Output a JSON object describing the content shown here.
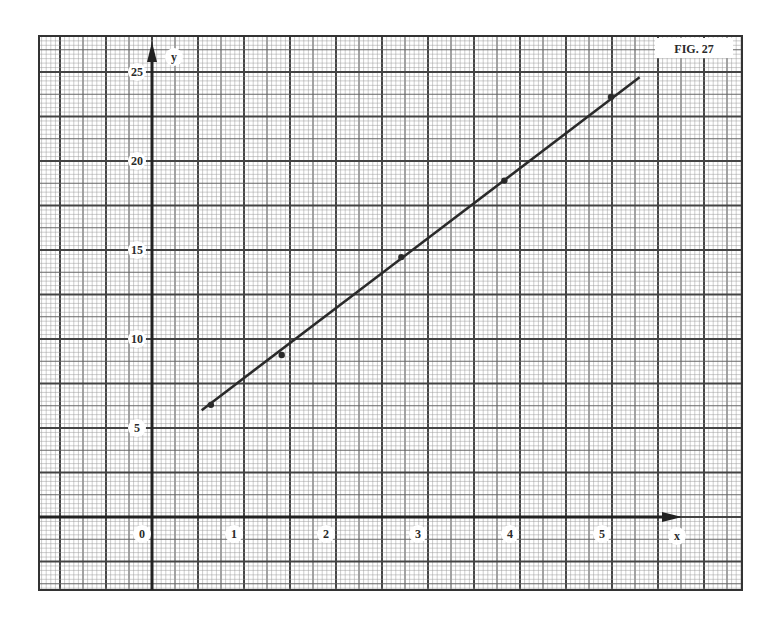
{
  "figure_label": "FIG. 27",
  "chart_data": {
    "type": "scatter",
    "title": "FIG. 27",
    "xlabel": "x",
    "ylabel": "y",
    "x_ticks": [
      0,
      1,
      2,
      3,
      4,
      5
    ],
    "y_ticks": [
      5,
      10,
      15,
      20,
      25
    ],
    "xlim": [
      -1.2,
      6.4
    ],
    "ylim": [
      -4.1,
      27.1
    ],
    "grid": true,
    "grid_style": "graph paper (major, medium, minor lines)",
    "points": [
      {
        "x": 0.64,
        "y": 6.3
      },
      {
        "x": 1.41,
        "y": 9.1
      },
      {
        "x": 2.71,
        "y": 14.6
      },
      {
        "x": 3.83,
        "y": 18.9
      },
      {
        "x": 4.99,
        "y": 23.6
      }
    ],
    "best_fit_line": {
      "x_start": 0.54,
      "y_start": 6.0,
      "x_end": 5.3,
      "y_end": 24.7
    },
    "colors": {
      "line": "#2a2a2a",
      "grid": "#555555",
      "background": "#ffffff"
    }
  },
  "axis": {
    "x_label": "x",
    "y_label": "y",
    "x_tick_labels": [
      "0",
      "1",
      "2",
      "3",
      "4",
      "5"
    ],
    "y_tick_labels": [
      "5",
      "10",
      "15",
      "20",
      "25"
    ]
  }
}
